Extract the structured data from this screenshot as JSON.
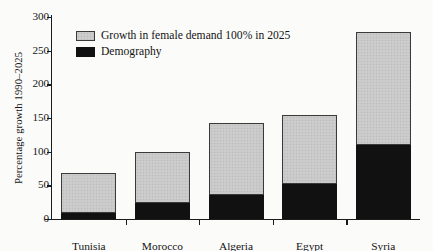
{
  "chart_data": {
    "type": "bar",
    "title": "",
    "subtitle": "",
    "xlabel": "",
    "ylabel": "Percentage growth 1990–2025",
    "ylim": [
      0,
      300
    ],
    "yticks": [
      0,
      50,
      100,
      150,
      200,
      250,
      300
    ],
    "ytick_labels": [
      "0",
      "50",
      "100",
      "150",
      "200",
      "250",
      "300"
    ],
    "grid": false,
    "stacked": true,
    "legend_position": "upper-left-inside",
    "categories": [
      "Tunisia",
      "Morocco",
      "Algeria",
      "Egypt",
      "Syria"
    ],
    "series": [
      {
        "name": "Demography",
        "color": "#111111",
        "values": [
          9,
          24,
          36,
          52,
          110
        ]
      },
      {
        "name": "Growth in female demand 100% in 2025",
        "color": "#c9c9c9",
        "values": [
          59,
          76,
          107,
          103,
          168
        ]
      }
    ],
    "totals": [
      68,
      100,
      143,
      155,
      278
    ],
    "annotations": []
  },
  "legend": {
    "items": [
      {
        "label": "Growth in female demand 100% in 2025",
        "swatch": "growth-swatch"
      },
      {
        "label": "Demography",
        "swatch": "demography-swatch"
      }
    ]
  }
}
